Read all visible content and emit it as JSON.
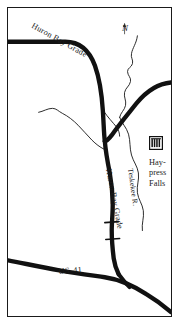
{
  "figure": {
    "kind": "line-drawing-map",
    "region": "Huron Bay Grade / Haypress Falls area",
    "background_color": "#ffffff",
    "ink_color": "#111111",
    "border_color": "#1a1a1a"
  },
  "labels": {
    "road_top": "Huron Bay Grade",
    "north_marker": "N",
    "road_vertical": "Huron Bay Grade",
    "river": "Teskekee R.",
    "falls_line1": "Hay-",
    "falls_line2": "press",
    "falls_line3": "Falls",
    "highway": "US-41"
  },
  "icons": {
    "falls_symbol": "waterfall-icon",
    "north_arrow": "north-arrow-icon",
    "bridge": "bridge-crossing-icon"
  },
  "features": [
    {
      "name": "Huron Bay Grade",
      "type": "road",
      "weight": "thick"
    },
    {
      "name": "Teskekee R.",
      "type": "river",
      "weight": "thin"
    },
    {
      "name": "US-41",
      "type": "highway",
      "weight": "thick"
    },
    {
      "name": "Haypress Falls",
      "type": "waterfall",
      "weight": "symbol"
    },
    {
      "name": "unnamed trail",
      "type": "trail",
      "weight": "thin"
    }
  ]
}
